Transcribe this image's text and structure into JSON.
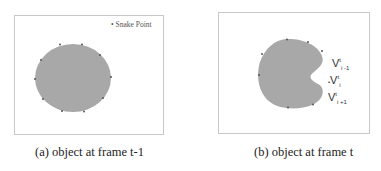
{
  "figure": {
    "panels": [
      {
        "id": "a",
        "caption": "(a) object at frame t-1",
        "legend": "Snake Point",
        "legend_marker": "•"
      },
      {
        "id": "b",
        "caption": "(b) object at frame t",
        "labels": [
          {
            "base": "V",
            "sup": "t",
            "sub": "i -1"
          },
          {
            "base": "V",
            "sup": "t",
            "sub": "i",
            "prefix": "•"
          },
          {
            "base": "V",
            "sup": "t",
            "sub": "i +1"
          }
        ]
      }
    ],
    "colors": {
      "object_fill": "#a8a8a8",
      "snake_point": "#555555",
      "frame_border": "#c8c8c8"
    }
  }
}
